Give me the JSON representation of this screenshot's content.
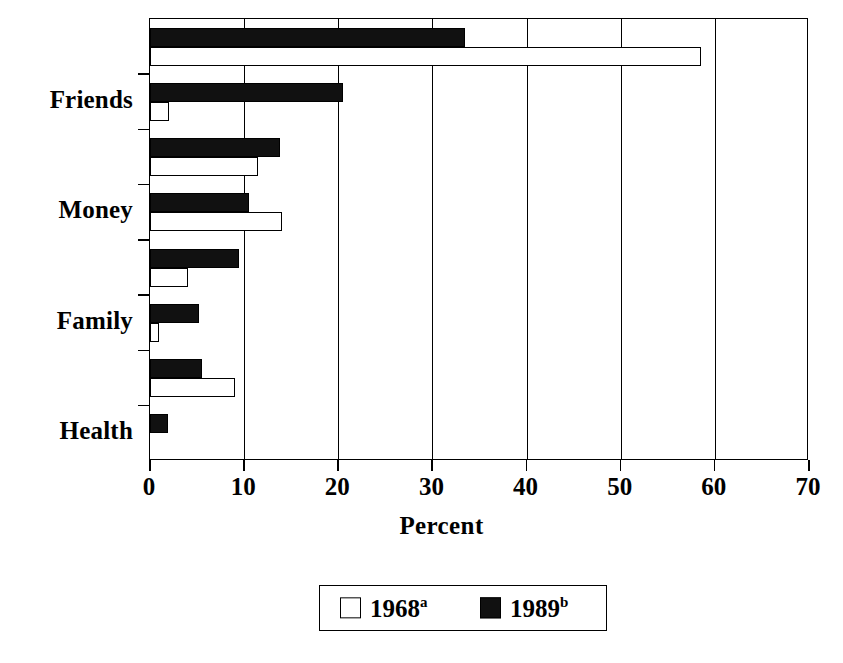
{
  "chart_data": {
    "type": "bar",
    "orientation": "horizontal",
    "title": "",
    "xlabel": "Percent",
    "ylabel": "",
    "xlim": [
      0,
      70
    ],
    "xticks": [
      0,
      10,
      20,
      30,
      40,
      50,
      60,
      70
    ],
    "xtick_labels": [
      "0",
      "10",
      "20",
      "30",
      "40",
      "50",
      "60",
      "70"
    ],
    "grid": "vertical",
    "legend_position": "bottom-center",
    "categories": [
      "Health",
      "",
      "Family",
      "",
      "Money",
      "",
      "Friends",
      ""
    ],
    "visible_category_labels": [
      "Friends",
      "Money",
      "Family",
      "Health"
    ],
    "series": [
      {
        "name": "1968",
        "name_superscript": "a",
        "color": "#ffffff",
        "edge_color": "#000000",
        "values": [
          58.5,
          2.0,
          11.5,
          14.0,
          4.0,
          1.0,
          9.0,
          0.0
        ]
      },
      {
        "name": "1989",
        "name_superscript": "b",
        "color": "#111111",
        "edge_color": "#000000",
        "values": [
          33.5,
          20.5,
          13.8,
          10.5,
          9.5,
          5.2,
          5.5,
          1.9
        ]
      }
    ]
  },
  "axis": {
    "x_title": "Percent",
    "x_tick_labels": [
      "0",
      "10",
      "20",
      "30",
      "40",
      "50",
      "60",
      "70"
    ],
    "y_category_labels": [
      "Friends",
      "Money",
      "Family",
      "Health"
    ]
  },
  "legend": {
    "entries": [
      {
        "label": "1968",
        "superscript": "a",
        "swatch": "white-square-icon"
      },
      {
        "label": "1989",
        "superscript": "b",
        "swatch": "black-square-icon"
      }
    ]
  },
  "colors": {
    "series_1968": "#ffffff",
    "series_1989": "#111111",
    "axis": "#000000",
    "background": "#ffffff"
  }
}
